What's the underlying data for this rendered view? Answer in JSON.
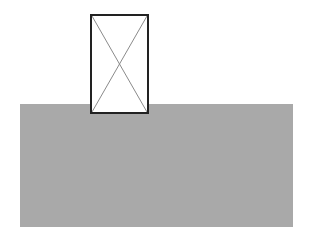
{
  "diagram": {
    "shapes": [
      {
        "type": "rectangle",
        "role": "base-slab",
        "fill": "#a9a9a9"
      },
      {
        "type": "image-placeholder",
        "role": "box-with-x",
        "fill": "#ffffff",
        "stroke": "#222222",
        "cross_color": "#8a8a8a"
      }
    ]
  }
}
